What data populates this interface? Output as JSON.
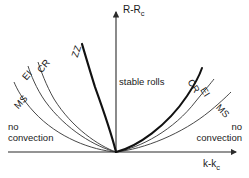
{
  "chart_data": {
    "type": "line",
    "title": "",
    "xlabel": "k-k_c",
    "ylabel": "R-R_c",
    "xlabel_main": "k-k",
    "xlabel_sub": "c",
    "ylabel_main": "R-R",
    "ylabel_sub": "c",
    "grid": false,
    "legend": "none",
    "axes": {
      "origin_px": [
        116,
        152
      ],
      "x_axis_from_px": [
        8,
        152
      ],
      "x_axis_to_px": [
        240,
        152
      ],
      "y_axis_from_px": [
        116,
        152
      ],
      "y_axis_to_px": [
        116,
        8
      ],
      "x_has_arrow": true,
      "y_has_arrow": true,
      "x_ticks": [],
      "y_ticks": []
    },
    "regions": [
      {
        "name": "stable-rolls",
        "label": "stable rolls"
      },
      {
        "name": "no-convection-left",
        "label": "no convection"
      },
      {
        "name": "no-convection-right",
        "label": "no convection"
      }
    ],
    "series": [
      {
        "name": "ZZ",
        "label": "ZZ",
        "side": "left",
        "emphasis": "thick",
        "stroke": "#111111",
        "stroke_width": 2.2,
        "points_px": [
          [
            116,
            152
          ],
          [
            112,
            140
          ],
          [
            107,
            124
          ],
          [
            101,
            105
          ],
          [
            95,
            86
          ],
          [
            88,
            63
          ],
          [
            82,
            44
          ]
        ]
      },
      {
        "name": "CR-left",
        "label": "CR",
        "side": "left",
        "emphasis": "thin",
        "stroke": "#333333",
        "stroke_width": 0.9,
        "points_px": [
          [
            116,
            152
          ],
          [
            108,
            147
          ],
          [
            97,
            140
          ],
          [
            84,
            128
          ],
          [
            71,
            113
          ],
          [
            58,
            95
          ],
          [
            46,
            76
          ],
          [
            38,
            62
          ]
        ]
      },
      {
        "name": "EI-left",
        "label": "EI",
        "side": "left",
        "emphasis": "thin",
        "stroke": "#333333",
        "stroke_width": 0.9,
        "points_px": [
          [
            116,
            152
          ],
          [
            106,
            148
          ],
          [
            93,
            142
          ],
          [
            78,
            131
          ],
          [
            63,
            117
          ],
          [
            49,
            99
          ],
          [
            37,
            80
          ],
          [
            28,
            66
          ]
        ]
      },
      {
        "name": "MS-left",
        "label": "MS",
        "side": "left",
        "emphasis": "thin",
        "stroke": "#333333",
        "stroke_width": 0.9,
        "points_px": [
          [
            116,
            152
          ],
          [
            103,
            149
          ],
          [
            88,
            145
          ],
          [
            71,
            137
          ],
          [
            54,
            126
          ],
          [
            38,
            111
          ],
          [
            24,
            95
          ],
          [
            14,
            82
          ]
        ]
      },
      {
        "name": "CR-right",
        "label": "CR",
        "side": "right",
        "emphasis": "thick",
        "stroke": "#111111",
        "stroke_width": 2.0,
        "points_px": [
          [
            116,
            152
          ],
          [
            128,
            148
          ],
          [
            142,
            141
          ],
          [
            158,
            129
          ],
          [
            173,
            113
          ],
          [
            186,
            95
          ],
          [
            196,
            79
          ],
          [
            202,
            68
          ]
        ]
      },
      {
        "name": "EI-right",
        "label": "EI",
        "side": "right",
        "emphasis": "thin",
        "stroke": "#333333",
        "stroke_width": 0.9,
        "points_px": [
          [
            116,
            152
          ],
          [
            131,
            149
          ],
          [
            147,
            144
          ],
          [
            164,
            134
          ],
          [
            180,
            121
          ],
          [
            194,
            105
          ],
          [
            206,
            90
          ],
          [
            214,
            79
          ]
        ]
      },
      {
        "name": "MS-right",
        "label": "MS",
        "side": "right",
        "emphasis": "thin",
        "stroke": "#333333",
        "stroke_width": 0.9,
        "points_px": [
          [
            116,
            152
          ],
          [
            134,
            150
          ],
          [
            152,
            147
          ],
          [
            170,
            141
          ],
          [
            188,
            131
          ],
          [
            205,
            118
          ],
          [
            220,
            104
          ],
          [
            231,
            92
          ]
        ]
      }
    ],
    "curve_labels": {
      "zz": "ZZ",
      "cr_left": "CR",
      "ei_left": "EI",
      "ms_left": "MS",
      "cr_right": "CR",
      "ei_right": "EI",
      "ms_right": "MS"
    },
    "colors": {
      "background": "#ffffff",
      "axis": "#2b2b2b",
      "curve_thin": "#333333",
      "curve_thick": "#111111",
      "text": "#1a1a1a"
    }
  }
}
